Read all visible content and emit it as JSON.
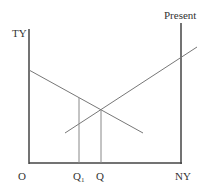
{
  "diagram": {
    "labels": {
      "y_axis": "TY",
      "right_axis": "Present",
      "origin": "O",
      "q1_main": "Q",
      "q1_sub": "1",
      "q": "Q",
      "x_axis_end": "NY"
    },
    "colors": {
      "axis": "#444444",
      "curve": "#777777",
      "text": "#333333"
    },
    "lines": {
      "left_axis": {
        "x1": 29,
        "y1": 29,
        "x2": 29,
        "y2": 164
      },
      "bottom_axis": {
        "x1": 29,
        "y1": 163,
        "x2": 182,
        "y2": 163
      },
      "right_axis": {
        "x1": 181,
        "y1": 23,
        "x2": 181,
        "y2": 164
      },
      "downward_line": {
        "x1": 29,
        "y1": 70,
        "x2": 143,
        "y2": 133
      },
      "upward_line": {
        "x1": 65,
        "y1": 133,
        "x2": 197,
        "y2": 47
      },
      "q1_drop": {
        "x1": 79,
        "y1": 98,
        "x2": 79,
        "y2": 163
      },
      "q_drop": {
        "x1": 101,
        "y1": 110,
        "x2": 101,
        "y2": 163
      }
    }
  }
}
